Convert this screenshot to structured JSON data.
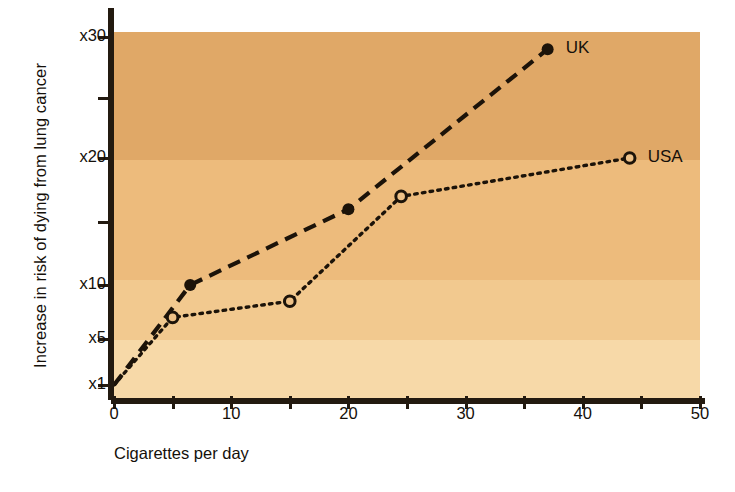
{
  "chart_data": {
    "type": "line",
    "title": "",
    "xlabel": "Cigarettes per day",
    "ylabel": "Increase in risk of dying from lung cancer",
    "xlim": [
      0,
      50
    ],
    "ylim": [
      1,
      30
    ],
    "grid": false,
    "legend_position": "inline-right-of-series-end",
    "xticks": [
      {
        "value": 0,
        "label": "0"
      },
      {
        "value": 5,
        "label": ""
      },
      {
        "value": 10,
        "label": "10"
      },
      {
        "value": 15,
        "label": ""
      },
      {
        "value": 20,
        "label": "20"
      },
      {
        "value": 25,
        "label": ""
      },
      {
        "value": 30,
        "label": "30"
      },
      {
        "value": 35,
        "label": ""
      },
      {
        "value": 40,
        "label": "40"
      },
      {
        "value": 45,
        "label": ""
      },
      {
        "value": 50,
        "label": "50"
      }
    ],
    "yticks": [
      {
        "value": 30,
        "label": "x30"
      },
      {
        "value": 25,
        "label": ""
      },
      {
        "value": 20,
        "label": "x20"
      },
      {
        "value": 15,
        "label": ""
      },
      {
        "value": 10,
        "label": "x10"
      },
      {
        "value": 5,
        "label": "x5"
      },
      {
        "value": 1,
        "label": "x1"
      }
    ],
    "series": [
      {
        "name": "UK",
        "label": "UK",
        "marker": "filled-circle",
        "linestyle": "dashed",
        "color": "#1c1309",
        "points": [
          {
            "x": 0,
            "y": 1
          },
          {
            "x": 6.5,
            "y": 10
          },
          {
            "x": 20,
            "y": 16
          },
          {
            "x": 37,
            "y": 29
          }
        ]
      },
      {
        "name": "USA",
        "label": "USA",
        "marker": "open-circle",
        "linestyle": "dotted",
        "color": "#1c1309",
        "points": [
          {
            "x": 0,
            "y": 1
          },
          {
            "x": 5,
            "y": 7
          },
          {
            "x": 15,
            "y": 8.5
          },
          {
            "x": 24.5,
            "y": 17
          },
          {
            "x": 44,
            "y": 20
          }
        ]
      }
    ],
    "colors": {
      "plot_background_top": "#e0a867",
      "plot_background_mid": "#edbb7c",
      "plot_background_low": "#f2c98f",
      "plot_background_bottom": "#f7d9a8",
      "axis": "#231a10",
      "ink": "#15100a",
      "page": "#ffffff"
    }
  }
}
